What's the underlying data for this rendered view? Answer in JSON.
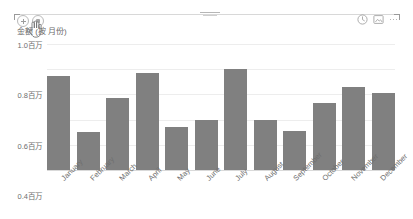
{
  "toolbar_left": {
    "buttons": [
      {
        "name": "add-icon",
        "label": "+"
      },
      {
        "name": "format-brush-icon",
        "label": "■"
      }
    ],
    "cursor": "hand-pointer-cursor"
  },
  "toolbar_right": {
    "buttons": [
      {
        "name": "focus-mode-icon",
        "label": "⊕"
      },
      {
        "name": "export-image-icon",
        "label": "⧉"
      }
    ],
    "more_label": "...",
    "more_name": "more-options-icon"
  },
  "chart_data": {
    "type": "bar",
    "title": "",
    "ylabel": "金额 (按 月份)",
    "xlabel": "",
    "categories": [
      "January",
      "February",
      "March",
      "April",
      "May",
      "June",
      "July",
      "August",
      "September",
      "October",
      "November",
      "December"
    ],
    "values": [
      0.75,
      0.3,
      0.57,
      0.77,
      0.34,
      0.4,
      0.8,
      0.4,
      0.31,
      0.53,
      0.66,
      0.61
    ],
    "unit": "百万",
    "ytick_labels": [
      "1.0百万",
      "0.8百万",
      "0.6百万",
      "0.4百万",
      "0.2百万",
      "0.0百万"
    ],
    "ytick_values": [
      1.0,
      0.8,
      0.6,
      0.4,
      0.2,
      0.0
    ],
    "ylim": [
      0,
      1.0
    ],
    "grid": true,
    "legend": "none",
    "bar_color": "#808080",
    "gridline_color": "#ededed",
    "axis_color": "#d9d9d9",
    "text_color": "#6e6e6e"
  }
}
